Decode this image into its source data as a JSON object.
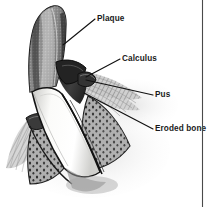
{
  "figure": {
    "background_color": "#ffffff",
    "border_color": "#4a4a4a",
    "line_color": "#111111",
    "text_color": "#1a1a1a"
  },
  "labels": [
    {
      "id": "plaque",
      "text": "Plaque",
      "x": 97,
      "y": 21,
      "leader": "M95,19 L63,45"
    },
    {
      "id": "calculus",
      "text": "Calculus",
      "x": 122,
      "y": 61,
      "leader": "M120,59 L86,77"
    },
    {
      "id": "pus",
      "text": "Pus",
      "x": 155,
      "y": 97,
      "leader": "M153,95 L86,80"
    },
    {
      "id": "eroded-bone",
      "text": "Eroded bone",
      "x": 155,
      "y": 131,
      "leader": "M153,129 L84,93"
    }
  ],
  "anatomy": {
    "structures": [
      {
        "id": "tooth-crown",
        "name": "Tooth crown with plaque deposit",
        "fill": "#8e8e8e"
      },
      {
        "id": "tooth-root",
        "name": "Tooth root",
        "fill": "#f5f5f2"
      },
      {
        "id": "calculus-band",
        "name": "Calculus deposit",
        "fill": "#2b2b2b"
      },
      {
        "id": "gum-tissue",
        "name": "Gingival tissue",
        "fill": "#b9b9b9"
      },
      {
        "id": "eroded-bone-area",
        "name": "Eroded alveolar bone",
        "fill": "#9a9a9a"
      },
      {
        "id": "pus-pocket",
        "name": "Periodontal pocket with pus",
        "fill": "#6d6d6d"
      }
    ]
  },
  "border": {
    "vertical_rule_x": 202
  }
}
